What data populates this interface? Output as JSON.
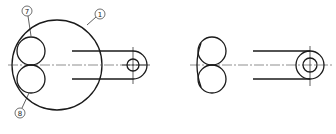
{
  "figure": {
    "left_view": {
      "labels": [
        {
          "id": "label-7",
          "text": "7",
          "x": 27,
          "y": 11
        },
        {
          "id": "label-1",
          "text": "1",
          "x": 100,
          "y": 14
        },
        {
          "id": "label-8",
          "text": "8",
          "x": 20,
          "y": 113
        }
      ],
      "parts": [
        "large-circle",
        "upper-small-circle",
        "lower-small-circle",
        "arm",
        "arm-end-hole"
      ]
    },
    "right_view": {
      "parts": [
        "double-circle-profile",
        "arm",
        "ring-end"
      ]
    },
    "colors": {
      "line": "#1a1a1a",
      "background": "#ffffff"
    }
  }
}
